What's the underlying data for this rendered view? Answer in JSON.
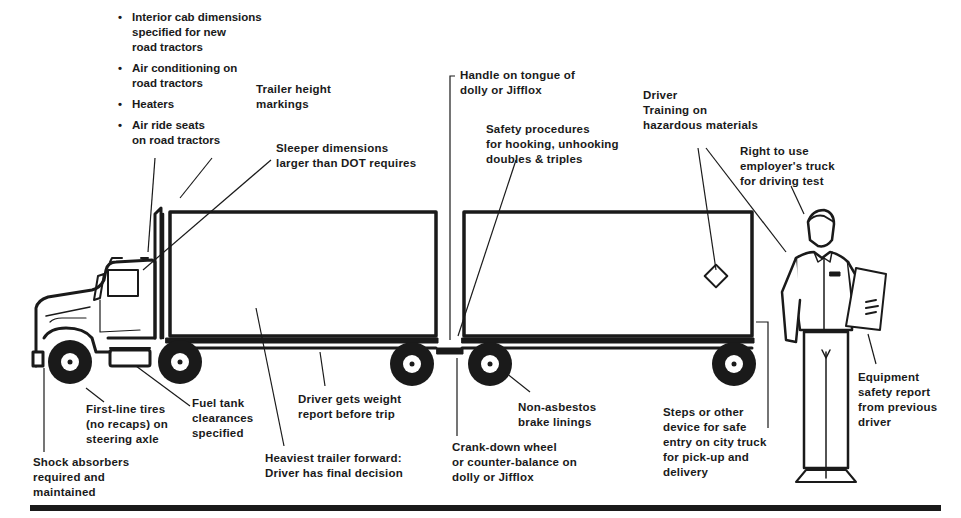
{
  "diagram": {
    "bullet_symbol": "•",
    "cab_features": [
      "Interior cab dimensions\nspecified for new\nroad tractors",
      "Air conditioning on\nroad tractors",
      "Heaters",
      "Air ride seats\non road tractors"
    ],
    "labels": {
      "trailer_height": "Trailer height\nmarkings",
      "sleeper": "Sleeper dimensions\nlarger than DOT requires",
      "handle": "Handle on tongue of\ndolly or Jifflox",
      "safety_procedures": "Safety procedures\nfor hooking, unhooking\ndoubles & triples",
      "hazmat": "Driver\nTraining on\nhazardous materials",
      "right_to_use": "Right to use\nemployer's truck\nfor driving test",
      "first_line_tires": "First-line tires\n(no recaps) on\nsteering axle",
      "fuel_tank": "Fuel tank\nclearances\nspecified",
      "weight_report": "Driver gets weight\nreport before trip",
      "heaviest_trailer": "Heaviest trailer forward:\nDriver has final decision",
      "shock_absorbers": "Shock absorbers\nrequired and\nmaintained",
      "crank_down": "Crank-down wheel\nor counter-balance on\ndolly or Jifflox",
      "non_asbestos": "Non-asbestos\nbrake linings",
      "steps": "Steps or other\ndevice for safe\nentry on city truck\nfor pick-up and\ndelivery",
      "equipment_report": "Equipment\nsafety report\nfrom previous\ndriver"
    },
    "colors": {
      "ink": "#1a1a1a",
      "background": "#ffffff"
    }
  }
}
